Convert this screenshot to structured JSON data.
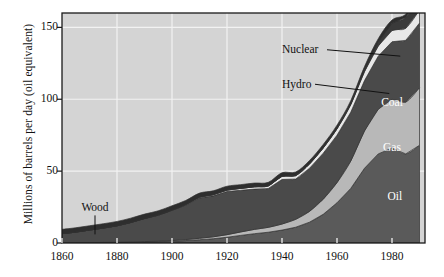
{
  "chart_data": {
    "type": "area",
    "stacked": true,
    "title": "",
    "subtitle": "",
    "xlabel": "",
    "ylabel": "Millions of barrels per day (oil equivalent)",
    "xlim": [
      1860,
      1992
    ],
    "ylim": [
      0,
      160
    ],
    "xticks": [
      1860,
      1880,
      1900,
      1920,
      1940,
      1960,
      1980
    ],
    "xtick_labels": [
      "1860",
      "1880",
      "1900",
      "1920",
      "1940",
      "1960",
      "1980"
    ],
    "yticks": [
      0,
      50,
      100,
      150
    ],
    "ytick_labels": [
      "0",
      "50",
      "100",
      "150"
    ],
    "grid": true,
    "grid_color": "#f2f2f2",
    "plot_background": "#d4d4d4",
    "legend": "in-plot labels",
    "legend_position": "inside-right",
    "annotations": [
      {
        "label": "Wood",
        "x": 1872,
        "y": 22,
        "leader_to_x": 1872,
        "leader_to_y": 6
      },
      {
        "label": "Hydro",
        "x": 1940,
        "y": 108,
        "leader_to_x": 1979,
        "leader_to_y": 104
      },
      {
        "label": "Nuclear",
        "x": 1940,
        "y": 132,
        "leader_to_x": 1983,
        "leader_to_y": 130
      },
      {
        "label": "Coal",
        "x": 1980,
        "y": 95,
        "leader_to_x": null,
        "leader_to_y": null
      },
      {
        "label": "Gas",
        "x": 1980,
        "y": 64,
        "leader_to_x": null,
        "leader_to_y": null
      },
      {
        "label": "Oil",
        "x": 1981,
        "y": 30,
        "leader_to_x": null,
        "leader_to_y": null
      }
    ],
    "x": [
      1860,
      1865,
      1870,
      1875,
      1880,
      1885,
      1890,
      1895,
      1900,
      1905,
      1910,
      1915,
      1920,
      1925,
      1930,
      1935,
      1940,
      1945,
      1950,
      1955,
      1960,
      1965,
      1970,
      1975,
      1980,
      1985,
      1990
    ],
    "series": [
      {
        "name": "Oil",
        "color": "#5a5a5a",
        "values": [
          0.0,
          0.1,
          0.2,
          0.3,
          0.4,
          0.5,
          0.7,
          0.9,
          1.2,
          1.7,
          2.3,
          3.0,
          4.0,
          5.3,
          6.5,
          7.5,
          9.0,
          11.0,
          14.5,
          20.0,
          28.0,
          38.0,
          52.0,
          62.0,
          66.0,
          62.0,
          68.0
        ]
      },
      {
        "name": "Gas",
        "color": "#b8b8b8",
        "values": [
          0.0,
          0.0,
          0.0,
          0.1,
          0.1,
          0.2,
          0.3,
          0.4,
          0.5,
          0.7,
          1.0,
          1.3,
          1.8,
          2.4,
          3.0,
          3.4,
          4.2,
          5.5,
          7.5,
          10.5,
          14.0,
          19.0,
          26.0,
          31.0,
          34.0,
          36.0,
          40.0
        ]
      },
      {
        "name": "Coal",
        "color": "#4a4a4a",
        "values": [
          6.5,
          7.5,
          8.8,
          10.0,
          11.5,
          13.5,
          16.0,
          18.0,
          21.0,
          24.0,
          28.0,
          28.5,
          30.0,
          29.0,
          28.0,
          27.0,
          31.0,
          28.0,
          30.0,
          32.0,
          33.0,
          34.0,
          35.0,
          37.0,
          40.0,
          43.0,
          45.0
        ]
      },
      {
        "name": "Hydro",
        "color": "#e8e8e8",
        "values": [
          0.0,
          0.0,
          0.0,
          0.0,
          0.0,
          0.1,
          0.1,
          0.2,
          0.3,
          0.4,
          0.6,
          0.8,
          1.0,
          1.3,
          1.6,
          1.8,
          2.2,
          2.4,
          3.0,
          3.6,
          4.4,
          5.2,
          6.2,
          7.0,
          7.8,
          8.4,
          9.0
        ]
      },
      {
        "name": "Nuclear",
        "color": "#3a3a3a",
        "values": [
          0.0,
          0.0,
          0.0,
          0.0,
          0.0,
          0.0,
          0.0,
          0.0,
          0.0,
          0.0,
          0.0,
          0.0,
          0.0,
          0.0,
          0.0,
          0.0,
          0.0,
          0.0,
          0.0,
          0.1,
          0.2,
          0.5,
          1.2,
          2.8,
          5.0,
          7.5,
          9.5
        ]
      },
      {
        "name": "Wood",
        "color": "#2e2e2e",
        "values": [
          3.0,
          3.0,
          3.0,
          3.0,
          3.0,
          3.0,
          3.0,
          2.9,
          2.9,
          2.8,
          2.8,
          2.7,
          2.7,
          2.6,
          2.6,
          2.5,
          2.5,
          2.5,
          2.4,
          2.4,
          2.4,
          2.3,
          2.3,
          2.3,
          2.3,
          2.3,
          2.3
        ]
      }
    ]
  }
}
